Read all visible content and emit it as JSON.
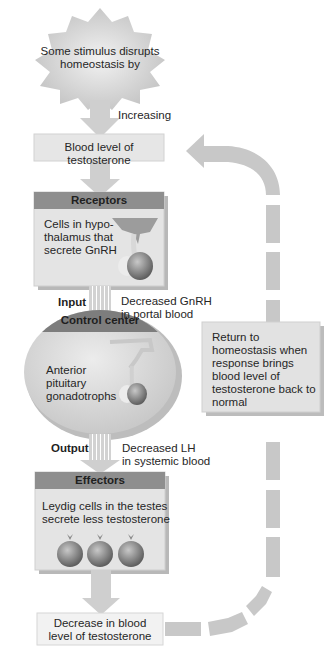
{
  "diagram": {
    "stimulus": {
      "text": "Some stimulus disrupts homeostasis by",
      "line1": "Some stimulus disrupts",
      "line2": "homeostasis by"
    },
    "stimulus_arrow_label": "Increasing",
    "variable_box": {
      "text": "Blood level of testosterone"
    },
    "receptors": {
      "header": "Receptors",
      "line1": "Cells in hypo-",
      "line2": "thalamus that",
      "line3": "secrete GnRH"
    },
    "input": {
      "label": "Input",
      "line1": "Decreased GnRH",
      "line2": "in portal blood"
    },
    "control_center": {
      "header": "Control center",
      "line1": "Anterior",
      "line2": "pituitary",
      "line3": "gonadotrophs"
    },
    "output": {
      "label": "Output",
      "line1": "Decreased LH",
      "line2": "in systemic blood"
    },
    "effectors": {
      "header": "Effectors",
      "line1": "Leydig cells in the testes",
      "line2": "secrete less testosterone",
      "cell_count": 3
    },
    "response_box": {
      "line1": "Decrease in blood",
      "line2": "level of testosterone"
    },
    "feedback_box": {
      "line1": "Return to",
      "line2": "homeostasis when",
      "line3": "response brings",
      "line4": "blood level of",
      "line5": "testosterone back to",
      "line6": "normal"
    },
    "colors": {
      "arrow_fill": "#cfcfcf",
      "box_fill": "#e4e4e4",
      "header_fill": "#8e8e8e",
      "control_header": "#7d7d7d",
      "oval_fill": "#d9d9d9",
      "shadow": "#b5b5b5",
      "feedback_arrow": "#c8c8c8",
      "cell_fill": "#8a8a8a"
    }
  }
}
